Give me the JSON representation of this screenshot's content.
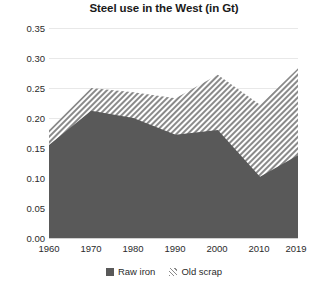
{
  "chart_data": {
    "type": "area",
    "title": "Steel use in the West (in Gt)",
    "xlabel": "",
    "ylabel": "",
    "stacked": true,
    "grid": true,
    "legend_position": "bottom",
    "x": [
      1960,
      1970,
      1980,
      1990,
      2000,
      2010,
      2019
    ],
    "categories": [
      "1960",
      "1970",
      "1980",
      "1990",
      "2000",
      "2010",
      "2019"
    ],
    "xlim": [
      1960,
      2019
    ],
    "ylim": [
      0.0,
      0.35
    ],
    "yticks": [
      "0.00",
      "0.05",
      "0.10",
      "0.15",
      "0.20",
      "0.25",
      "0.30",
      "0.35"
    ],
    "ytick_values": [
      0.0,
      0.05,
      0.1,
      0.15,
      0.2,
      0.25,
      0.3,
      0.35
    ],
    "series": [
      {
        "name": "Raw iron",
        "values": [
          0.155,
          0.212,
          0.2,
          0.172,
          0.18,
          0.102,
          0.138
        ],
        "color": "#595959",
        "fill": "solid"
      },
      {
        "name": "Old scrap",
        "values": [
          0.025,
          0.038,
          0.043,
          0.061,
          0.092,
          0.12,
          0.145
        ],
        "color": "#808080",
        "fill": "diagonal-hatch"
      }
    ],
    "totals": [
      0.18,
      0.25,
      0.243,
      0.233,
      0.272,
      0.222,
      0.283
    ]
  },
  "legend": {
    "items": [
      {
        "label": "Raw iron",
        "swatch": "solid-dark-gray"
      },
      {
        "label": "Old scrap",
        "swatch": "hatched-gray"
      }
    ]
  },
  "colors": {
    "raw_iron": "#595959",
    "old_scrap_hatch": "#8a8a8a",
    "gridline": "#e8e8e8",
    "text": "#2b2b2b",
    "background": "#ffffff"
  }
}
